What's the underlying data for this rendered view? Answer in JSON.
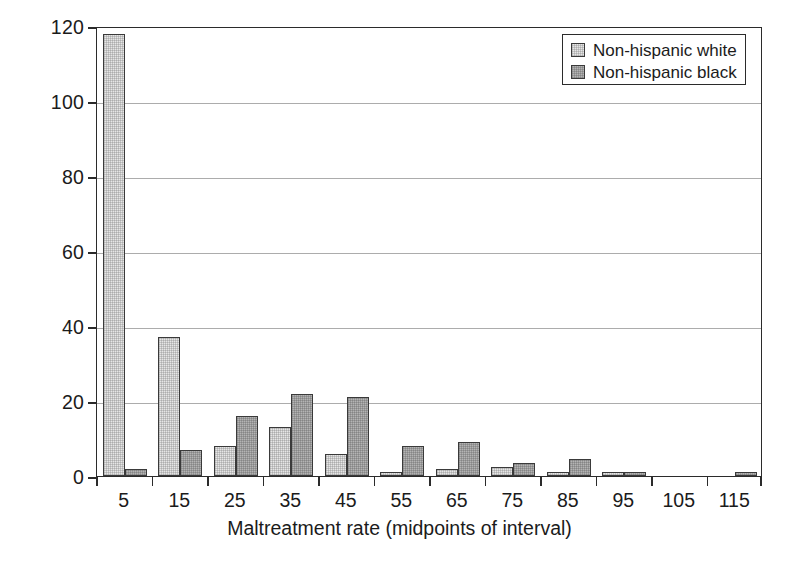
{
  "chart_data": {
    "type": "bar",
    "title": "",
    "xlabel": "Maltreatment rate (midpoints of interval)",
    "ylabel": "Number of tracts",
    "categories": [
      "5",
      "15",
      "25",
      "35",
      "45",
      "55",
      "65",
      "75",
      "85",
      "95",
      "105",
      "115"
    ],
    "xtick_labels": [
      "5",
      "15",
      "25",
      "35",
      "45",
      "55",
      "65",
      "75",
      "85",
      "95",
      "105",
      "115"
    ],
    "ytick_labels": [
      "0",
      "20",
      "40",
      "60",
      "80",
      "100",
      "120"
    ],
    "ylim": [
      0,
      120
    ],
    "ytick_step": 20,
    "grid": "horizontal",
    "legend_position": "top-right",
    "series": [
      {
        "name": "Non-hispanic white",
        "color": "#e6e6e6",
        "values": [
          118,
          37,
          8,
          13,
          6,
          1,
          2,
          2.5,
          1,
          1,
          0,
          0
        ]
      },
      {
        "name": "Non-hispanic black",
        "color": "#b4b4b4",
        "values": [
          2,
          7,
          16,
          22,
          21,
          8,
          9,
          3.5,
          4.5,
          1,
          0,
          1
        ]
      }
    ]
  },
  "legend": {
    "items": [
      {
        "label": "Non-hispanic white",
        "swatch": "white"
      },
      {
        "label": "Non-hispanic black",
        "swatch": "black"
      }
    ]
  }
}
